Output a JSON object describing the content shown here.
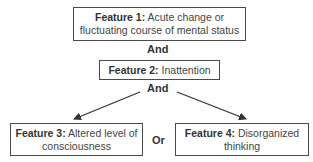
{
  "diagram": {
    "feature1": {
      "label": "Feature 1:",
      "text": "Acute change or",
      "text2": "fluctuating course of mental status"
    },
    "connector1": "And",
    "feature2": {
      "label": "Feature 2:",
      "text": "Inattention"
    },
    "connector2": "And",
    "feature3": {
      "label": "Feature 3:",
      "text": "Altered level of",
      "text2": "consciousness"
    },
    "connector3": "Or",
    "feature4": {
      "label": "Feature 4:",
      "text": "Disorganized",
      "text2": "thinking"
    }
  },
  "colors": {
    "border": "#4a4a4a",
    "text": "#444444",
    "background": "#ffffff"
  }
}
